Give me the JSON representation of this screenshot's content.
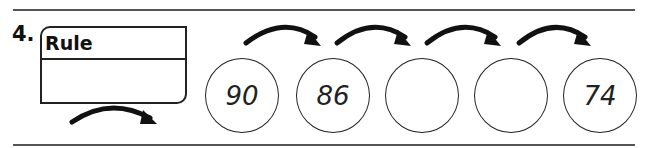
{
  "problem": {
    "number": "4.",
    "rule_label": "Rule",
    "rule_value": "",
    "sequence": [
      {
        "value": "90"
      },
      {
        "value": "86"
      },
      {
        "value": ""
      },
      {
        "value": ""
      },
      {
        "value": "74"
      }
    ]
  },
  "colors": {
    "line": "#555555",
    "ink": "#222222"
  }
}
